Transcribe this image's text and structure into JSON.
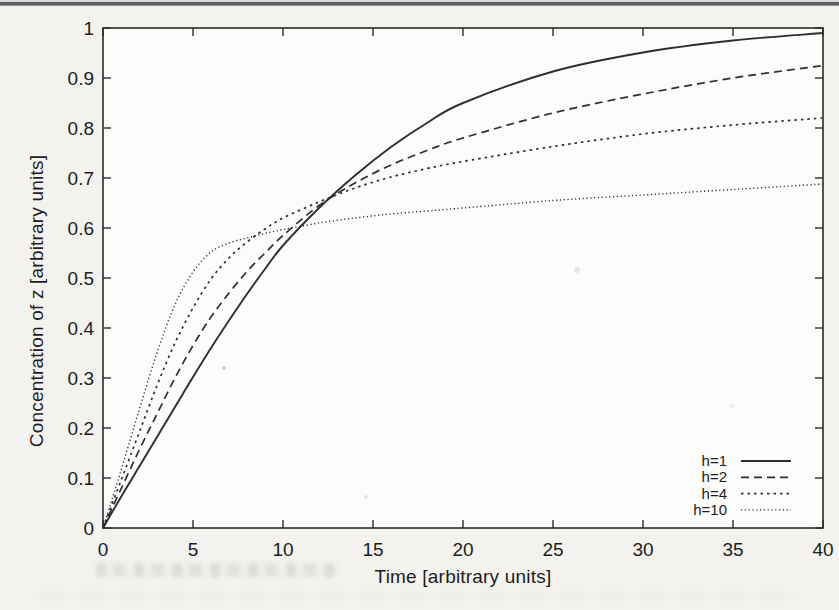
{
  "chart_data": {
    "type": "line",
    "title": "",
    "xlabel": "Time [arbitrary units]",
    "ylabel": "Concentration of z [arbitrary units]",
    "xlim": [
      0,
      40
    ],
    "ylim": [
      0,
      1
    ],
    "xticks": [
      0,
      5,
      10,
      15,
      20,
      25,
      30,
      35,
      40
    ],
    "xtick_labels": [
      "0",
      "5",
      "10",
      "15",
      "20",
      "25",
      "30",
      "35",
      "40"
    ],
    "yticks": [
      0,
      0.1,
      0.2,
      0.3,
      0.4,
      0.5,
      0.6,
      0.7,
      0.8,
      0.9,
      1
    ],
    "ytick_labels": [
      "0",
      "0.1",
      "0.2",
      "0.3",
      "0.4",
      "0.5",
      "0.6",
      "0.7",
      "0.8",
      "0.9",
      "1"
    ],
    "grid": false,
    "legend_position": "inside bottom-right",
    "x": [
      0,
      1,
      2,
      3,
      4,
      5,
      6,
      7,
      8,
      9,
      10,
      12,
      14,
      16,
      18,
      20,
      25,
      30,
      35,
      40
    ],
    "series": [
      {
        "name": "h=1",
        "style": "solid",
        "values": [
          0,
          0.062,
          0.122,
          0.182,
          0.242,
          0.302,
          0.36,
          0.415,
          0.468,
          0.518,
          0.565,
          0.64,
          0.705,
          0.762,
          0.81,
          0.85,
          0.913,
          0.951,
          0.975,
          0.99
        ]
      },
      {
        "name": "h=2",
        "style": "dashed",
        "values": [
          0,
          0.078,
          0.155,
          0.228,
          0.3,
          0.365,
          0.422,
          0.47,
          0.513,
          0.55,
          0.585,
          0.645,
          0.69,
          0.726,
          0.755,
          0.78,
          0.83,
          0.868,
          0.9,
          0.925
        ]
      },
      {
        "name": "h=4",
        "style": "dotted",
        "values": [
          0,
          0.095,
          0.19,
          0.285,
          0.37,
          0.44,
          0.498,
          0.54,
          0.572,
          0.598,
          0.62,
          0.652,
          0.68,
          0.702,
          0.719,
          0.733,
          0.763,
          0.788,
          0.806,
          0.82
        ]
      },
      {
        "name": "h=10",
        "style": "fine-dotted",
        "values": [
          0,
          0.115,
          0.235,
          0.35,
          0.447,
          0.512,
          0.552,
          0.57,
          0.58,
          0.589,
          0.597,
          0.61,
          0.62,
          0.628,
          0.634,
          0.64,
          0.655,
          0.666,
          0.677,
          0.688
        ]
      }
    ],
    "colors": {
      "line": "#2e2e2e",
      "frame": "#2b2b2b",
      "text": "#1d1d1d",
      "plot_background": "#fcfcfb",
      "page_background": "#f3f2ef"
    }
  }
}
